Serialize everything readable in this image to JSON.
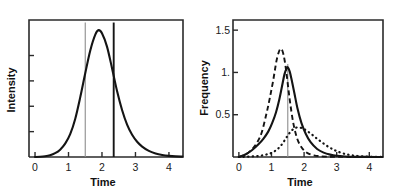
{
  "figure": {
    "title": "",
    "panel_count": 2,
    "background_color": "#ffffff",
    "ink_color": "#141414"
  },
  "chart_data": [
    {
      "id": "left-panel",
      "type": "line",
      "title": "",
      "xlabel": "Time",
      "ylabel": "Intensity",
      "xlim": [
        -0.18,
        4.42
      ],
      "ylim": [
        0,
        1.08
      ],
      "grid": false,
      "legend": "none",
      "xticks": [
        0,
        1,
        2,
        3,
        4
      ],
      "xticklabels": [
        "0",
        "1",
        "2",
        "3",
        "4"
      ],
      "yticks": [
        0.2,
        0.4,
        0.6,
        0.8
      ],
      "yticklabels": [
        "",
        "",
        "",
        ""
      ],
      "series": [
        {
          "name": "intensity",
          "style": "solid",
          "x": [
            0.0,
            0.15,
            0.3,
            0.45,
            0.6,
            0.75,
            0.9,
            1.05,
            1.2,
            1.35,
            1.5,
            1.65,
            1.8,
            1.9,
            2.0,
            2.15,
            2.3,
            2.45,
            2.6,
            2.75,
            2.9,
            3.05,
            3.2,
            3.4,
            3.6,
            3.8,
            4.0,
            4.2,
            4.4
          ],
          "y": [
            0.0,
            0.002,
            0.006,
            0.014,
            0.03,
            0.058,
            0.105,
            0.18,
            0.3,
            0.47,
            0.66,
            0.84,
            0.965,
            1.0,
            0.975,
            0.87,
            0.7,
            0.52,
            0.37,
            0.255,
            0.175,
            0.12,
            0.082,
            0.048,
            0.028,
            0.016,
            0.009,
            0.005,
            0.003
          ]
        }
      ],
      "annotations": [
        {
          "kind": "vertical-line",
          "x": 1.5,
          "style": "thin-gray",
          "y_from": 0.0,
          "y_to": 1.06
        },
        {
          "kind": "vertical-line",
          "x": 2.35,
          "style": "thick-black",
          "y_from": 0.0,
          "y_to": 1.06
        }
      ]
    },
    {
      "id": "right-panel",
      "type": "line",
      "title": "",
      "xlabel": "Time",
      "ylabel": "Frequency",
      "xlim": [
        -0.18,
        4.42
      ],
      "ylim": [
        0,
        1.62
      ],
      "grid": false,
      "legend": "none",
      "xticks": [
        0,
        1,
        2,
        3,
        4
      ],
      "xticklabels": [
        "0",
        "1",
        "2",
        "3",
        "4"
      ],
      "yticks": [
        0.5,
        1.0,
        1.5
      ],
      "yticklabels": [
        "0.5",
        "1.",
        "1.5"
      ],
      "series": [
        {
          "name": "dashed-distribution",
          "style": "dashed",
          "peak_x": 1.28,
          "peak_y": 1.28,
          "x": [
            0.0,
            0.2,
            0.4,
            0.55,
            0.7,
            0.85,
            0.95,
            1.05,
            1.15,
            1.22,
            1.28,
            1.34,
            1.4,
            1.46,
            1.52,
            1.58,
            1.66,
            1.74,
            1.82,
            1.92,
            2.02,
            2.15,
            2.3,
            2.5,
            2.75,
            3.0,
            3.3,
            3.7,
            4.2,
            4.4
          ],
          "y": [
            0.0,
            0.028,
            0.09,
            0.165,
            0.29,
            0.52,
            0.7,
            0.9,
            1.13,
            1.235,
            1.28,
            1.25,
            1.15,
            0.99,
            0.8,
            0.62,
            0.42,
            0.28,
            0.185,
            0.115,
            0.07,
            0.038,
            0.02,
            0.009,
            0.004,
            0.002,
            0.001,
            0.0,
            0.0,
            0.0
          ]
        },
        {
          "name": "solid-distribution",
          "style": "solid",
          "peak_x": 1.48,
          "peak_y": 1.06,
          "x": [
            0.0,
            0.2,
            0.4,
            0.6,
            0.75,
            0.9,
            1.02,
            1.14,
            1.24,
            1.32,
            1.4,
            1.46,
            1.5,
            1.56,
            1.62,
            1.7,
            1.8,
            1.92,
            2.05,
            2.2,
            2.4,
            2.6,
            2.8,
            3.0,
            3.25,
            3.55,
            3.9,
            4.2,
            4.4
          ],
          "y": [
            0.0,
            0.03,
            0.08,
            0.15,
            0.215,
            0.3,
            0.4,
            0.53,
            0.68,
            0.83,
            0.98,
            1.045,
            1.06,
            1.01,
            0.91,
            0.76,
            0.57,
            0.4,
            0.275,
            0.175,
            0.095,
            0.052,
            0.028,
            0.014,
            0.006,
            0.002,
            0.001,
            0.0,
            0.0
          ]
        },
        {
          "name": "dotted-distribution",
          "style": "dotted",
          "peak_x": 1.8,
          "peak_y": 0.35,
          "x": [
            0.0,
            0.3,
            0.6,
            0.85,
            1.0,
            1.15,
            1.28,
            1.4,
            1.5,
            1.6,
            1.7,
            1.8,
            1.9,
            2.0,
            2.12,
            2.25,
            2.4,
            2.55,
            2.7,
            2.85,
            3.0,
            3.2,
            3.45,
            3.75,
            4.1,
            4.4
          ],
          "y": [
            0.0,
            0.004,
            0.012,
            0.03,
            0.048,
            0.082,
            0.13,
            0.195,
            0.255,
            0.305,
            0.338,
            0.35,
            0.345,
            0.33,
            0.3,
            0.262,
            0.215,
            0.172,
            0.132,
            0.098,
            0.07,
            0.042,
            0.021,
            0.008,
            0.002,
            0.001
          ]
        }
      ],
      "annotations": [
        {
          "kind": "vertical-line",
          "x": 1.5,
          "style": "thin-gray",
          "y_from": 0.0,
          "y_to": 1.1
        }
      ]
    }
  ]
}
